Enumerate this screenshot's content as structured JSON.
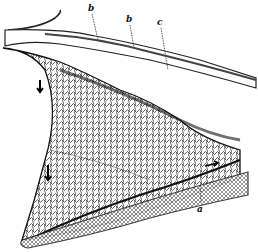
{
  "figure": {
    "labels": [
      {
        "id": "b1",
        "text": "b",
        "x": 90,
        "y": 4
      },
      {
        "id": "b2",
        "text": "b",
        "x": 128,
        "y": 15
      },
      {
        "id": "c",
        "text": "c",
        "x": 159,
        "y": 19
      },
      {
        "id": "a",
        "text": "a",
        "x": 199,
        "y": 206
      }
    ],
    "arrows": [
      {
        "id": "arrow-upper",
        "x": 40,
        "y": 85
      },
      {
        "id": "arrow-lower",
        "x": 48,
        "y": 170
      },
      {
        "id": "arrow-right",
        "x": 212,
        "y": 165
      }
    ],
    "colors": {
      "ink": "#1a1a1a",
      "paper": "#ffffff"
    }
  }
}
